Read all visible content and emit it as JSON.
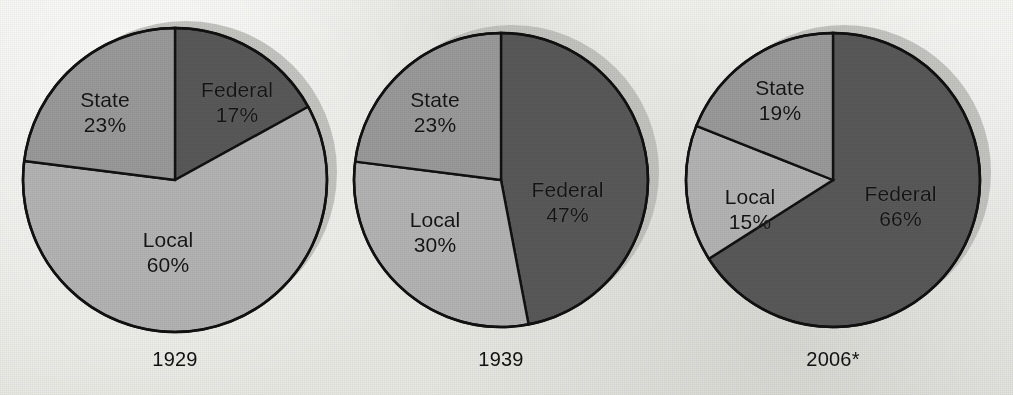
{
  "figure": {
    "background_color": "#eeeeea",
    "outline_color": "#111111"
  },
  "colors": {
    "federal": "#595959",
    "state": "#9a9a9a",
    "local": "#b4b4b4",
    "shadow": "#b9b9b5",
    "outline": "#111111",
    "text": "#141414"
  },
  "chart_data": {
    "type": "pie",
    "title": "",
    "subtitle": "",
    "xlabel": "",
    "ylabel": "",
    "legend_position": "inline-labels",
    "grid": false,
    "categories": [
      "Federal",
      "State",
      "Local"
    ],
    "charts": [
      {
        "year_label": "1929",
        "slices": [
          {
            "name": "Federal",
            "value": 17,
            "label": "Federal",
            "pct_label": "17%",
            "color": "#595959"
          },
          {
            "name": "Local",
            "value": 60,
            "label": "Local",
            "pct_label": "60%",
            "color": "#b4b4b4"
          },
          {
            "name": "State",
            "value": 23,
            "label": "State",
            "pct_label": "23%",
            "color": "#9a9a9a"
          }
        ]
      },
      {
        "year_label": "1939",
        "slices": [
          {
            "name": "Federal",
            "value": 47,
            "label": "Federal",
            "pct_label": "47%",
            "color": "#595959"
          },
          {
            "name": "Local",
            "value": 30,
            "label": "Local",
            "pct_label": "30%",
            "color": "#b4b4b4"
          },
          {
            "name": "State",
            "value": 23,
            "label": "State",
            "pct_label": "23%",
            "color": "#9a9a9a"
          }
        ]
      },
      {
        "year_label": "2006*",
        "slices": [
          {
            "name": "Federal",
            "value": 66,
            "label": "Federal",
            "pct_label": "66%",
            "color": "#595959"
          },
          {
            "name": "Local",
            "value": 15,
            "label": "Local",
            "pct_label": "15%",
            "color": "#b4b4b4"
          },
          {
            "name": "State",
            "value": 19,
            "label": "State",
            "pct_label": "19%",
            "color": "#9a9a9a"
          }
        ]
      }
    ]
  },
  "labels": {
    "c0": {
      "federal_name": "Federal",
      "federal_pct": "17%",
      "state_name": "State",
      "state_pct": "23%",
      "local_name": "Local",
      "local_pct": "60%",
      "year": "1929"
    },
    "c1": {
      "federal_name": "Federal",
      "federal_pct": "47%",
      "state_name": "State",
      "state_pct": "23%",
      "local_name": "Local",
      "local_pct": "30%",
      "year": "1939"
    },
    "c2": {
      "federal_name": "Federal",
      "federal_pct": "66%",
      "state_name": "State",
      "state_pct": "19%",
      "local_name": "Local",
      "local_pct": "15%",
      "year": "2006*"
    }
  }
}
